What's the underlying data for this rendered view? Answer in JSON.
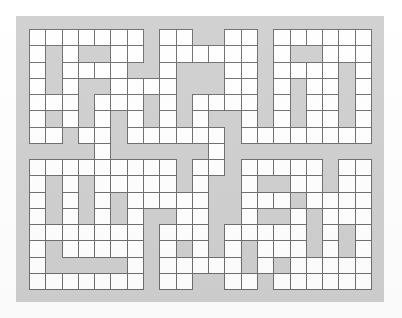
{
  "page": {
    "background_color": "#ffffff"
  },
  "puzzle": {
    "name": "crossword-grid",
    "columns": 21,
    "rows": 16,
    "cell_size_px": 16.3,
    "open_cell_color": "#ffffff",
    "block_cell_color": "#cfcfcf",
    "grid_line_color": "#6e6e6e",
    "panel_background_color": "#cfcfcf",
    "legend": {
      "open": "1 = open letter cell (white square)",
      "block": "0 = blocked cell (gray, no square)"
    },
    "matrix": [
      [
        1,
        1,
        1,
        1,
        1,
        1,
        1,
        0,
        1,
        1,
        0,
        0,
        1,
        1,
        0,
        1,
        1,
        1,
        1,
        1,
        1
      ],
      [
        1,
        0,
        1,
        0,
        0,
        1,
        1,
        0,
        1,
        1,
        1,
        1,
        1,
        1,
        0,
        1,
        0,
        0,
        1,
        1,
        1
      ],
      [
        1,
        0,
        1,
        1,
        1,
        1,
        0,
        0,
        1,
        0,
        0,
        0,
        1,
        1,
        0,
        1,
        1,
        1,
        1,
        0,
        1
      ],
      [
        1,
        0,
        1,
        0,
        0,
        1,
        1,
        1,
        1,
        0,
        0,
        0,
        1,
        1,
        0,
        1,
        0,
        1,
        1,
        0,
        1
      ],
      [
        1,
        1,
        1,
        0,
        1,
        1,
        1,
        0,
        1,
        0,
        1,
        1,
        1,
        1,
        0,
        1,
        0,
        1,
        1,
        0,
        1
      ],
      [
        1,
        0,
        1,
        0,
        1,
        0,
        1,
        0,
        1,
        0,
        1,
        0,
        0,
        1,
        0,
        1,
        0,
        1,
        1,
        0,
        1
      ],
      [
        1,
        1,
        0,
        1,
        1,
        0,
        1,
        1,
        1,
        1,
        1,
        1,
        0,
        1,
        1,
        1,
        1,
        1,
        1,
        1,
        1
      ],
      [
        0,
        0,
        0,
        0,
        1,
        0,
        0,
        0,
        0,
        0,
        0,
        1,
        0,
        0,
        0,
        0,
        0,
        0,
        0,
        0,
        0
      ],
      [
        1,
        1,
        1,
        1,
        1,
        1,
        1,
        1,
        1,
        0,
        1,
        1,
        0,
        1,
        1,
        1,
        1,
        1,
        0,
        1,
        1
      ],
      [
        1,
        0,
        1,
        0,
        1,
        1,
        1,
        1,
        1,
        0,
        1,
        0,
        0,
        1,
        0,
        0,
        1,
        1,
        0,
        1,
        1
      ],
      [
        1,
        0,
        1,
        0,
        1,
        0,
        1,
        1,
        1,
        1,
        1,
        0,
        0,
        1,
        1,
        1,
        0,
        1,
        1,
        1,
        1
      ],
      [
        1,
        0,
        1,
        0,
        1,
        0,
        1,
        0,
        0,
        1,
        1,
        0,
        0,
        1,
        0,
        0,
        1,
        0,
        1,
        1,
        1
      ],
      [
        1,
        1,
        1,
        1,
        1,
        1,
        1,
        0,
        1,
        1,
        1,
        0,
        1,
        1,
        1,
        1,
        1,
        0,
        1,
        0,
        1
      ],
      [
        1,
        0,
        1,
        1,
        1,
        1,
        1,
        0,
        1,
        0,
        1,
        0,
        1,
        0,
        1,
        1,
        1,
        0,
        1,
        0,
        1
      ],
      [
        1,
        0,
        0,
        0,
        0,
        0,
        1,
        0,
        1,
        1,
        1,
        1,
        1,
        0,
        1,
        0,
        1,
        1,
        1,
        1,
        1
      ],
      [
        1,
        1,
        1,
        1,
        1,
        1,
        1,
        0,
        1,
        1,
        0,
        0,
        1,
        1,
        0,
        1,
        1,
        1,
        1,
        1,
        1
      ]
    ]
  }
}
